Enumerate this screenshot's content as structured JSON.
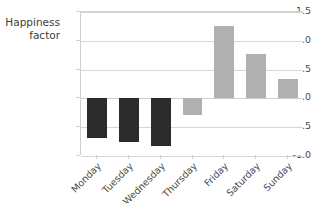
{
  "chart_data": {
    "type": "bar",
    "title": "",
    "xlabel": "",
    "ylabel": "Happiness\nfactor",
    "categories": [
      "Monday",
      "Tuesday",
      "Wednesday",
      "Thursday",
      "Friday",
      "Saturday",
      "Sunday"
    ],
    "values": [
      -0.69,
      -0.76,
      -0.82,
      -0.28,
      1.26,
      0.77,
      0.33
    ],
    "bar_colors": [
      "#2b2b2b",
      "#2b2b2b",
      "#2b2b2b",
      "#b0b0b0",
      "#b0b0b0",
      "#b0b0b0",
      "#b0b0b0"
    ],
    "ylim": [
      -1.0,
      1.5
    ],
    "yticks": [
      1.5,
      1.0,
      0.5,
      0.0,
      -0.5,
      -1.0
    ],
    "ytick_labels": [
      "1.5",
      "1.0",
      "0.5",
      "0.0",
      "-0.5",
      "-1.0"
    ],
    "grid": true,
    "grid_axis": "y",
    "legend": "none",
    "xtick_rotation": -45,
    "bar_width_ratio": 0.62
  },
  "colors": {
    "negative_bar": "#2b2b2b",
    "positive_bar": "#b0b0b0",
    "gridline": "#d6d6d6",
    "axis": "#cfcfcf",
    "text": "#4a4a4a",
    "background": "#ffffff"
  }
}
